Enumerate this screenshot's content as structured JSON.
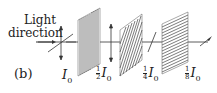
{
  "figure": {
    "panel_label": "(b)",
    "direction_label_line1": "Light",
    "direction_label_line2": "direction",
    "intensities": [
      {
        "num": "",
        "den": "",
        "symbol": "I",
        "sub": "0"
      },
      {
        "num": "1",
        "den": "2",
        "symbol": "I",
        "sub": "0"
      },
      {
        "num": "1",
        "den": "4",
        "symbol": "I",
        "sub": "0"
      },
      {
        "num": "1",
        "den": "8",
        "symbol": "I",
        "sub": "0"
      }
    ],
    "polarizers": [
      {
        "name": "vertical-polarizer",
        "orientation": "vertical"
      },
      {
        "name": "diagonal-polarizer",
        "orientation": "45deg"
      },
      {
        "name": "horizontal-polarizer",
        "orientation": "horizontal"
      }
    ]
  }
}
